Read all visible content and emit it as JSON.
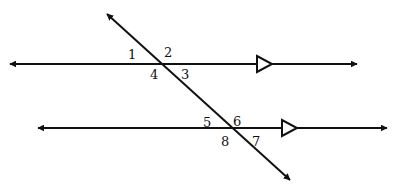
{
  "diagram": {
    "stroke_color": "#111111",
    "background": "#ffffff",
    "lines": [
      {
        "id": "parallel-line-top",
        "x1": 10,
        "y1": 64,
        "x2": 357,
        "y2": 64,
        "marker": "open-triangle",
        "marker_x": 257
      },
      {
        "id": "parallel-line-bottom",
        "x1": 38,
        "y1": 128,
        "x2": 387,
        "y2": 128,
        "marker": "open-triangle",
        "marker_x": 282
      },
      {
        "id": "transversal",
        "x1": 107,
        "y1": 14,
        "x2": 290,
        "y2": 180
      }
    ],
    "angle_labels": [
      {
        "text": "1",
        "x": 128,
        "y": 59
      },
      {
        "text": "2",
        "x": 164,
        "y": 57
      },
      {
        "text": "4",
        "x": 150,
        "y": 79
      },
      {
        "text": "3",
        "x": 181,
        "y": 79
      },
      {
        "text": "5",
        "x": 203,
        "y": 127
      },
      {
        "text": "6",
        "x": 233,
        "y": 126
      },
      {
        "text": "8",
        "x": 221,
        "y": 146
      },
      {
        "text": "7",
        "x": 252,
        "y": 146
      }
    ]
  }
}
